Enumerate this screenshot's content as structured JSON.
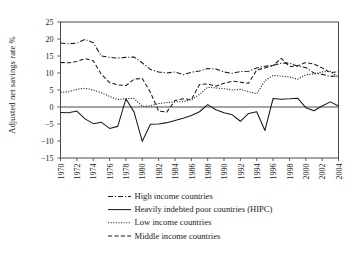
{
  "chart_data": {
    "type": "line",
    "title": "",
    "xlabel": "",
    "ylabel": "Adjusted net savings rate %",
    "ylim": [
      -15,
      25
    ],
    "yticks": [
      -15,
      -10,
      -5,
      0,
      5,
      10,
      15,
      20,
      25
    ],
    "xlim": [
      1970,
      2004
    ],
    "xticks": [
      1970,
      1972,
      1974,
      1976,
      1978,
      1980,
      1982,
      1984,
      1986,
      1988,
      1990,
      1992,
      1994,
      1996,
      1998,
      2000,
      2002,
      2004
    ],
    "xtick_labels": [
      "1970",
      "1972",
      "1974",
      "1976",
      "1978",
      "1980",
      "1982",
      "1984",
      "1986",
      "1988",
      "1990",
      "1992",
      "1994",
      "1996",
      "1998",
      "2000",
      "2002",
      "2004"
    ],
    "grid": false,
    "legend_position": "bottom",
    "x": [
      1970,
      1971,
      1972,
      1973,
      1974,
      1975,
      1976,
      1977,
      1978,
      1979,
      1980,
      1981,
      1982,
      1983,
      1984,
      1985,
      1986,
      1987,
      1988,
      1989,
      1990,
      1991,
      1992,
      1993,
      1994,
      1995,
      1996,
      1997,
      1998,
      1999,
      2000,
      2001,
      2002,
      2003,
      2004
    ],
    "series": [
      {
        "name": "High income countries",
        "style": "dash-dot",
        "values": [
          18.8,
          18.6,
          18.8,
          19.9,
          18.9,
          15.0,
          14.6,
          14.4,
          14.6,
          14.7,
          13.0,
          11.0,
          10.3,
          10.0,
          10.3,
          9.5,
          10.2,
          10.6,
          11.3,
          11.2,
          10.3,
          9.9,
          10.4,
          10.5,
          11.5,
          12.0,
          12.2,
          12.9,
          12.9,
          12.0,
          11.6,
          10.0,
          9.6,
          9.0,
          9.2
        ]
      },
      {
        "name": "Heavily indebted poor countries (HIPC)",
        "style": "solid",
        "values": [
          -1.6,
          -1.7,
          -1.2,
          -3.5,
          -4.9,
          -4.5,
          -6.3,
          -5.7,
          2.4,
          -1.5,
          -10.1,
          -5.1,
          -5.0,
          -4.6,
          -4.0,
          -3.3,
          -2.5,
          -1.4,
          0.7,
          -0.8,
          -1.7,
          -2.3,
          -4.2,
          -1.9,
          -1.4,
          -6.9,
          2.5,
          2.3,
          2.4,
          2.6,
          -0.2,
          -1.1,
          0.3,
          1.5,
          0.3
        ]
      },
      {
        "name": "Low income countries",
        "style": "dotted",
        "values": [
          4.3,
          4.5,
          5.2,
          5.5,
          5.0,
          4.2,
          3.1,
          2.2,
          2.5,
          2.5,
          0.2,
          0.3,
          1.0,
          1.3,
          1.5,
          1.6,
          2.1,
          3.7,
          5.8,
          5.6,
          5.4,
          5.0,
          5.2,
          4.5,
          3.9,
          7.7,
          9.3,
          9.1,
          8.8,
          8.2,
          9.5,
          9.7,
          10.3,
          10.5,
          8.6
        ]
      },
      {
        "name": "Middle income countries",
        "style": "dashed",
        "values": [
          13.1,
          13.0,
          13.4,
          14.2,
          13.6,
          9.6,
          7.2,
          6.5,
          6.3,
          8.2,
          8.4,
          4.3,
          -1.2,
          -1.5,
          1.9,
          2.4,
          2.2,
          6.6,
          6.8,
          6.1,
          7.0,
          7.6,
          7.3,
          7.0,
          10.9,
          11.5,
          12.2,
          14.3,
          11.9,
          12.1,
          13.1,
          12.6,
          11.5,
          10.1,
          10.4
        ]
      }
    ]
  },
  "legend": {
    "items": [
      {
        "label": "High income countries"
      },
      {
        "label": "Heavily indebted poor countries (HIPC)"
      },
      {
        "label": "Low income countries"
      },
      {
        "label": "Middle income countries"
      }
    ]
  },
  "colors": {
    "axis": "#4a4a4a",
    "line": "#1a1a1a",
    "background": "#ffffff"
  }
}
